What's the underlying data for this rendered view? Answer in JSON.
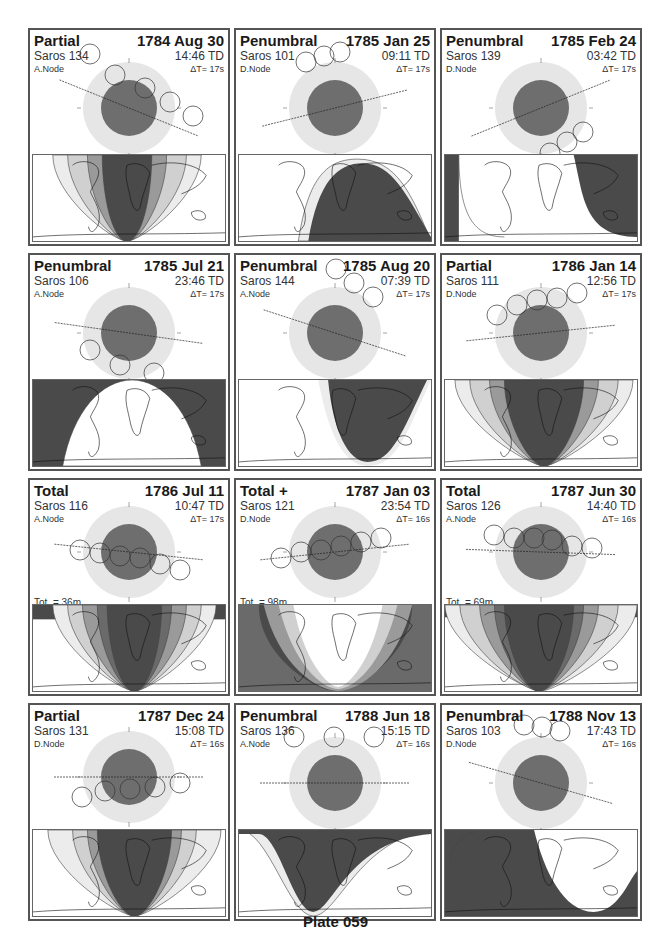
{
  "plate_title": "Plate 059",
  "colors": {
    "penumbra": "#e6e6e6",
    "umbra": "#6e6e6e",
    "map_dark": "#4a4a4a",
    "map_mid": "#9a9a9a",
    "map_light": "#d0d0d0",
    "map_lightest": "#ececec"
  },
  "panels": [
    {
      "type": "Partial",
      "date": "1784 Aug 30",
      "saros": "Saros 134",
      "time": "14:46 TD",
      "node": "A.Node",
      "dt": "ΔT=    17s",
      "stats_left": [
        "Par. = 161m",
        "Gam. = 0.6662"
      ],
      "stats_right": [
        "U.Mag. = 0.6602",
        "P.Mag. = 1.6104"
      ]
    },
    {
      "type": "Penumbral",
      "date": "1785 Jan 25",
      "saros": "Saros 101",
      "time": "09:11 TD",
      "node": "D.Node",
      "dt": "ΔT=    17s",
      "stats_left": [
        "Pen. = 103m",
        "Gam. = 1.5218"
      ],
      "stats_right": [
        "U.Mag. = -0.9807",
        "P.Mag. = 0.1128"
      ]
    },
    {
      "type": "Penumbral",
      "date": "1785 Feb 24",
      "saros": "Saros 139",
      "time": "03:42 TD",
      "node": "D.Node",
      "dt": "ΔT=    17s",
      "stats_left": [
        "Pen. = 126m",
        "Gam. = -1.4947"
      ],
      "stats_right": [
        "U.Mag. = -0.9330",
        "P.Mag. = 0.1648"
      ]
    },
    {
      "type": "Penumbral",
      "date": "1785 Jul 21",
      "saros": "Saros 106",
      "time": "23:46 TD",
      "node": "A.Node",
      "dt": "ΔT=    17s",
      "stats_left": [
        "Pen. = 218m",
        "Gam. = -1.1606"
      ],
      "stats_right": [
        "U.Mag. = -0.2567",
        "P.Mag. = 0.7134"
      ]
    },
    {
      "type": "Penumbral",
      "date": "1785 Aug 20",
      "saros": "Saros 144",
      "time": "07:39 TD",
      "node": "A.Node",
      "dt": "ΔT=    17s",
      "stats_left": [
        "Pen. = 143m",
        "Gam. = 1.3843"
      ],
      "stats_right": [
        "U.Mag. = -0.6597",
        "P.Mag. = 0.2954"
      ]
    },
    {
      "type": "Partial",
      "date": "1786 Jan 14",
      "saros": "Saros 111",
      "time": "12:56 TD",
      "node": "D.Node",
      "dt": "ΔT=    17s",
      "stats_left": [
        "Par. = 139m",
        "Gam. = 0.7838"
      ],
      "stats_right": [
        "U.Mag. = 0.3978",
        "P.Mag. = 1.4421"
      ]
    },
    {
      "type": "Total",
      "date": "1786 Jul 11",
      "saros": "Saros 116",
      "time": "10:47 TD",
      "node": "A.Node",
      "dt": "ΔT=    17s",
      "stats_left": [
        "Tot. =  36m",
        "Par. = 205m",
        "Gam. = -0.4324"
      ],
      "stats_right": [
        "U.Mag. = 1.0531",
        "P.Mag. = 2.0762"
      ]
    },
    {
      "type": "Total  +",
      "date": "1787 Jan 03",
      "saros": "Saros 121",
      "time": "23:54 TD",
      "node": "D.Node",
      "dt": "ΔT=    16s",
      "stats_left": [
        "Tot. =  98m",
        "Par. = 214m",
        "Gam. = 0.0632"
      ],
      "stats_right": [
        "U.Mag. = 1.7465",
        "P.Mag. = 2.7375"
      ]
    },
    {
      "type": "Total",
      "date": "1787 Jun 30",
      "saros": "Saros 126",
      "time": "14:40 TD",
      "node": "A.Node",
      "dt": "ΔT=    16s",
      "stats_left": [
        "Tot. =  69m",
        "Par. = 221m",
        "Gam. = 0.3441"
      ],
      "stats_right": [
        "U.Mag. = 1.1947",
        "P.Mag. = 2.2592"
      ]
    },
    {
      "type": "Partial",
      "date": "1787 Dec 24",
      "saros": "Saros 131",
      "time": "15:08 TD",
      "node": "D.Node",
      "dt": "ΔT=    16s",
      "stats_left": [
        "Par. = 170m",
        "Gam. = -0.6011"
      ],
      "stats_right": [
        "U.Mag. = 0.7696",
        "P.Mag. = 1.7404"
      ]
    },
    {
      "type": "Penumbral",
      "date": "1788 Jun 18",
      "saros": "Saros 136",
      "time": "15:15 TD",
      "node": "A.Node",
      "dt": "ΔT=    16s",
      "stats_left": [
        "Pen. = 266m",
        "Gam. = 1.0986"
      ],
      "stats_right": [
        "U.Mag. = -0.1883",
        "P.Mag. = 0.8734"
      ]
    },
    {
      "type": "Penumbral",
      "date": "1788 Nov 13",
      "saros": "Saros 103",
      "time": "17:43 TD",
      "node": "D.Node",
      "dt": "ΔT=    16s",
      "stats_left": [
        "Pen. = 117m",
        "Gam. = 1.4690"
      ],
      "stats_right": [
        "U.Mag. = -0.8471",
        "P.Mag. = 0.1726"
      ]
    }
  ]
}
